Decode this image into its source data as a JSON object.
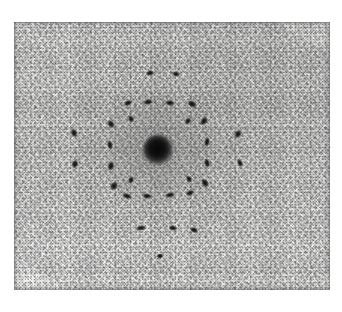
{
  "image": {
    "kind": "x-ray-diffraction-photograph",
    "description": "Grainy black-and-white X-ray (Laue/electron) diffraction photograph: a dense dark central beam spot surrounded by concentric square rings of discrete elongated diffraction reflections on a mottled silver-halide film background.",
    "orientation": "landscape",
    "canvas": {
      "width": 342,
      "height": 312
    },
    "margin": {
      "color": "#ffffff"
    },
    "plate": {
      "left": 14,
      "top": 22,
      "width": 316,
      "height": 268,
      "base_color": "#e2e2e0",
      "edge_color": "#7a7a7a",
      "grain": "heavy"
    },
    "beam_stop": {
      "label": "central-beam",
      "cx": 158,
      "cy": 150,
      "diameter": 30,
      "core_color": "#0b0b0b"
    },
    "halo": {
      "label": "central-diffuse-halo",
      "cx": 157,
      "cy": 150,
      "diameter": 120
    },
    "reflections": [
      {
        "id": "r01",
        "cx": 128,
        "cy": 103,
        "w": 8,
        "h": 5,
        "rot": -28
      },
      {
        "id": "r02",
        "cx": 148,
        "cy": 102,
        "w": 9,
        "h": 5,
        "rot": -8
      },
      {
        "id": "r03",
        "cx": 170,
        "cy": 103,
        "w": 9,
        "h": 5,
        "rot": 8
      },
      {
        "id": "r04",
        "cx": 192,
        "cy": 104,
        "w": 9,
        "h": 6,
        "rot": 26
      },
      {
        "id": "r05",
        "cx": 111,
        "cy": 124,
        "w": 6,
        "h": 8,
        "rot": -34
      },
      {
        "id": "r06",
        "cx": 110,
        "cy": 145,
        "w": 5,
        "h": 9,
        "rot": -10
      },
      {
        "id": "r07",
        "cx": 111,
        "cy": 166,
        "w": 6,
        "h": 9,
        "rot": 18
      },
      {
        "id": "r08",
        "cx": 114,
        "cy": 186,
        "w": 7,
        "h": 8,
        "rot": 40
      },
      {
        "id": "r09",
        "cx": 127,
        "cy": 196,
        "w": 9,
        "h": 5,
        "rot": 22
      },
      {
        "id": "r10",
        "cx": 147,
        "cy": 196,
        "w": 9,
        "h": 5,
        "rot": 6
      },
      {
        "id": "r11",
        "cx": 170,
        "cy": 195,
        "w": 9,
        "h": 5,
        "rot": -10
      },
      {
        "id": "r12",
        "cx": 190,
        "cy": 193,
        "w": 8,
        "h": 5,
        "rot": -28
      },
      {
        "id": "r13",
        "cx": 205,
        "cy": 183,
        "w": 6,
        "h": 9,
        "rot": -36
      },
      {
        "id": "r14",
        "cx": 207,
        "cy": 163,
        "w": 5,
        "h": 9,
        "rot": -14
      },
      {
        "id": "r15",
        "cx": 207,
        "cy": 142,
        "w": 5,
        "h": 9,
        "rot": 12
      },
      {
        "id": "r16",
        "cx": 204,
        "cy": 121,
        "w": 6,
        "h": 9,
        "rot": 34
      },
      {
        "id": "r17",
        "cx": 150,
        "cy": 73,
        "w": 8,
        "h": 5,
        "rot": -12
      },
      {
        "id": "r18",
        "cx": 176,
        "cy": 74,
        "w": 7,
        "h": 5,
        "rot": 14
      },
      {
        "id": "r19",
        "cx": 74,
        "cy": 133,
        "w": 6,
        "h": 8,
        "rot": -26
      },
      {
        "id": "r20",
        "cx": 75,
        "cy": 164,
        "w": 6,
        "h": 8,
        "rot": 20
      },
      {
        "id": "r21",
        "cx": 238,
        "cy": 134,
        "w": 6,
        "h": 8,
        "rot": 28
      },
      {
        "id": "r22",
        "cx": 240,
        "cy": 163,
        "w": 5,
        "h": 8,
        "rot": -22
      },
      {
        "id": "r23",
        "cx": 141,
        "cy": 228,
        "w": 9,
        "h": 5,
        "rot": -10
      },
      {
        "id": "r24",
        "cx": 173,
        "cy": 228,
        "w": 8,
        "h": 5,
        "rot": 10
      },
      {
        "id": "r25",
        "cx": 194,
        "cy": 230,
        "w": 8,
        "h": 5,
        "rot": 24
      },
      {
        "id": "r26",
        "cx": 160,
        "cy": 256,
        "w": 6,
        "h": 5,
        "rot": 0
      },
      {
        "id": "r27",
        "cx": 131,
        "cy": 119,
        "w": 5,
        "h": 7,
        "rot": -30
      },
      {
        "id": "r28",
        "cx": 188,
        "cy": 121,
        "w": 5,
        "h": 7,
        "rot": 30
      },
      {
        "id": "r29",
        "cx": 131,
        "cy": 180,
        "w": 5,
        "h": 7,
        "rot": 30
      },
      {
        "id": "r30",
        "cx": 189,
        "cy": 179,
        "w": 5,
        "h": 7,
        "rot": -30
      }
    ]
  }
}
